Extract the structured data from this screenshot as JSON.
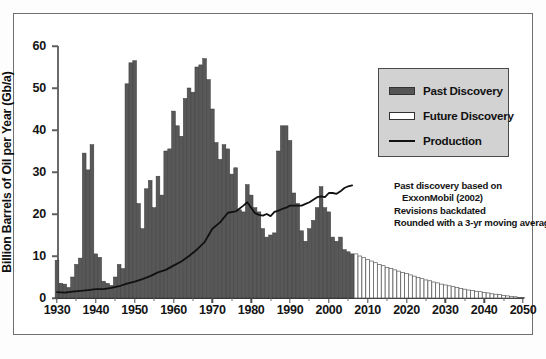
{
  "chart_data": {
    "type": "bar",
    "title": "",
    "subtitle": "",
    "xlabel": "",
    "ylabel": "Billion Barrels of Oil per Year (Gb/a)",
    "xlim": [
      1930,
      2050
    ],
    "ylim": [
      0,
      60
    ],
    "yticks": [
      0,
      10,
      20,
      30,
      40,
      50,
      60
    ],
    "xticks": [
      1930,
      1940,
      1950,
      1960,
      1970,
      1980,
      1990,
      2000,
      2010,
      2020,
      2030,
      2040,
      2050
    ],
    "grid": false,
    "legend_position": "upper-right",
    "legend": [
      {
        "name": "Past Discovery",
        "type": "bar",
        "color": "#555555"
      },
      {
        "name": "Future Discovery",
        "type": "bar",
        "color": "#ffffff"
      },
      {
        "name": "Production",
        "type": "line",
        "color": "#111111"
      }
    ],
    "annotation_lines": [
      "Past discovery based on",
      "ExxonMobil (2002)",
      "Revisions backdated",
      "Rounded with a 3-yr moving average"
    ],
    "series": [
      {
        "name": "Past Discovery",
        "type": "bar",
        "color": "#555555",
        "x": [
          1930,
          1931,
          1932,
          1933,
          1934,
          1935,
          1936,
          1937,
          1938,
          1939,
          1940,
          1941,
          1942,
          1943,
          1944,
          1945,
          1946,
          1947,
          1948,
          1949,
          1950,
          1951,
          1952,
          1953,
          1954,
          1955,
          1956,
          1957,
          1958,
          1959,
          1960,
          1961,
          1962,
          1963,
          1964,
          1965,
          1966,
          1967,
          1968,
          1969,
          1970,
          1971,
          1972,
          1973,
          1974,
          1975,
          1976,
          1977,
          1978,
          1979,
          1980,
          1981,
          1982,
          1983,
          1984,
          1985,
          1986,
          1987,
          1988,
          1989,
          1990,
          1991,
          1992,
          1993,
          1994,
          1995,
          1996,
          1997,
          1998,
          1999,
          2000,
          2001,
          2002,
          2003,
          2004,
          2005,
          2006
        ],
        "values": [
          9.0,
          3.5,
          3.3,
          2.5,
          5.0,
          8.0,
          9.5,
          34.5,
          30.5,
          36.5,
          10.5,
          9.7,
          4.0,
          3.5,
          3.0,
          5.0,
          8.0,
          7.0,
          51.0,
          56.0,
          56.5,
          22.5,
          16.5,
          26.0,
          28.0,
          21.5,
          29.0,
          24.5,
          35.0,
          35.5,
          44.5,
          41.0,
          38.5,
          47.5,
          50.0,
          49.0,
          55.0,
          55.5,
          57.0,
          52.0,
          45.0,
          37.0,
          33.0,
          36.5,
          35.5,
          29.5,
          31.0,
          21.0,
          20.5,
          27.0,
          24.5,
          21.5,
          20.5,
          16.5,
          14.5,
          15.0,
          15.5,
          35.0,
          41.0,
          41.0,
          37.5,
          25.0,
          22.5,
          16.0,
          13.5,
          16.5,
          18.5,
          21.5,
          26.5,
          21.5,
          20.5,
          14.5,
          13.5,
          14.5,
          11.5,
          11.0,
          10.5
        ]
      },
      {
        "name": "Future Discovery",
        "type": "bar",
        "color": "#ffffff",
        "x": [
          2007,
          2008,
          2009,
          2010,
          2011,
          2012,
          2013,
          2014,
          2015,
          2016,
          2017,
          2018,
          2019,
          2020,
          2021,
          2022,
          2023,
          2024,
          2025,
          2026,
          2027,
          2028,
          2029,
          2030,
          2031,
          2032,
          2033,
          2034,
          2035,
          2036,
          2037,
          2038,
          2039,
          2040,
          2041,
          2042,
          2043,
          2044,
          2045,
          2046,
          2047,
          2048,
          2049,
          2050
        ],
        "values": [
          10.5,
          10.0,
          9.6,
          9.2,
          8.8,
          8.4,
          8.0,
          7.7,
          7.3,
          7.0,
          6.7,
          6.4,
          6.1,
          5.8,
          5.5,
          5.2,
          4.9,
          4.6,
          4.3,
          4.1,
          3.8,
          3.6,
          3.3,
          3.1,
          2.9,
          2.7,
          2.5,
          2.3,
          2.1,
          1.9,
          1.8,
          1.6,
          1.5,
          1.3,
          1.2,
          1.0,
          0.9,
          0.8,
          0.6,
          0.5,
          0.4,
          0.3,
          0.15,
          0.05
        ]
      },
      {
        "name": "Production",
        "type": "line",
        "color": "#111111",
        "x": [
          1930,
          1932,
          1934,
          1936,
          1938,
          1940,
          1942,
          1944,
          1946,
          1948,
          1950,
          1952,
          1954,
          1956,
          1958,
          1960,
          1962,
          1964,
          1966,
          1968,
          1970,
          1972,
          1974,
          1976,
          1978,
          1979,
          1980,
          1981,
          1982,
          1983,
          1984,
          1985,
          1986,
          1987,
          1988,
          1989,
          1990,
          1991,
          1992,
          1993,
          1994,
          1995,
          1996,
          1997,
          1998,
          1999,
          2000,
          2001,
          2002,
          2003,
          2004,
          2005,
          2006
        ],
        "values": [
          1.4,
          1.3,
          1.5,
          1.7,
          1.9,
          2.1,
          2.1,
          2.4,
          2.8,
          3.4,
          3.9,
          4.5,
          5.2,
          6.1,
          6.7,
          7.7,
          8.7,
          10.0,
          11.5,
          13.3,
          16.5,
          18.0,
          20.3,
          20.6,
          22.0,
          22.8,
          21.5,
          20.2,
          19.8,
          19.6,
          20.0,
          19.5,
          20.5,
          20.8,
          21.2,
          21.5,
          22.0,
          22.0,
          22.0,
          22.0,
          22.4,
          22.8,
          23.4,
          24.0,
          24.2,
          24.0,
          25.0,
          25.0,
          24.8,
          25.4,
          26.2,
          26.6,
          26.8
        ]
      }
    ]
  },
  "axis": {
    "y_title": "Billion Barrels of Oil per Year (Gb/a)"
  }
}
